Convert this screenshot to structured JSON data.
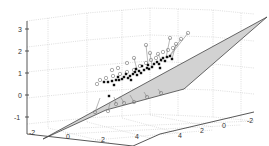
{
  "chart_data": {
    "type": "scatter",
    "subtype": "3d-scatter-with-regression-plane",
    "title": "",
    "xlabel": "",
    "ylabel": "",
    "zlabel": "",
    "x_ticks": [
      "-2",
      "0",
      "2",
      "4"
    ],
    "y_ticks": [
      "4",
      "2",
      "0",
      "-2"
    ],
    "z_ticks": [
      "3",
      "2",
      "1",
      "0",
      "-1"
    ],
    "xlim": [
      -2,
      5
    ],
    "ylim": [
      -2,
      5
    ],
    "zlim": [
      -1.2,
      3.2
    ],
    "grid": true,
    "legend": null,
    "plane_color": "#d2d2d2",
    "plane_edge_color": "#444444",
    "plane_vertices_px": [
      [
        43,
        139
      ],
      [
        267,
        17
      ],
      [
        184,
        89
      ],
      [
        106,
        110
      ]
    ],
    "filled_points_px": [
      [
        104,
        82
      ],
      [
        108,
        82
      ],
      [
        112,
        81
      ],
      [
        116,
        80
      ],
      [
        119,
        80
      ],
      [
        122,
        79
      ],
      [
        118,
        77
      ],
      [
        124,
        77
      ],
      [
        128,
        78
      ],
      [
        130,
        76
      ],
      [
        126,
        74
      ],
      [
        133,
        74
      ],
      [
        137,
        75
      ],
      [
        135,
        72
      ],
      [
        139,
        71
      ],
      [
        141,
        73
      ],
      [
        144,
        70
      ],
      [
        147,
        68
      ],
      [
        149,
        69
      ],
      [
        152,
        67
      ],
      [
        148,
        65
      ],
      [
        154,
        64
      ],
      [
        157,
        62
      ],
      [
        159,
        64
      ],
      [
        161,
        60
      ],
      [
        163,
        58
      ],
      [
        165,
        61
      ],
      [
        167,
        57
      ],
      [
        160,
        68
      ],
      [
        142,
        66
      ],
      [
        136,
        69
      ],
      [
        131,
        80
      ],
      [
        114,
        85
      ],
      [
        109,
        96
      ],
      [
        170,
        56
      ],
      [
        172,
        59
      ]
    ],
    "open_points_px": [
      [
        100,
        80
      ],
      [
        106,
        78
      ],
      [
        113,
        76
      ],
      [
        120,
        74
      ],
      [
        127,
        72
      ],
      [
        134,
        70
      ],
      [
        140,
        66
      ],
      [
        146,
        63
      ],
      [
        151,
        60
      ],
      [
        156,
        58
      ],
      [
        158,
        54
      ],
      [
        163,
        52
      ],
      [
        168,
        50
      ],
      [
        173,
        48
      ],
      [
        176,
        44
      ],
      [
        181,
        39
      ],
      [
        188,
        33
      ],
      [
        170,
        38
      ],
      [
        150,
        53
      ],
      [
        146,
        45
      ],
      [
        97,
        84
      ],
      [
        95,
        112
      ],
      [
        108,
        111
      ],
      [
        116,
        104
      ],
      [
        124,
        103
      ],
      [
        134,
        102
      ],
      [
        147,
        97
      ],
      [
        161,
        93
      ],
      [
        134,
        58
      ],
      [
        127,
        63
      ],
      [
        118,
        68
      ],
      [
        112,
        70
      ]
    ],
    "stems_px": [
      [
        [
          176,
          44
        ],
        [
          172,
          59
        ]
      ],
      [
        [
          181,
          39
        ],
        [
          168,
          58
        ]
      ],
      [
        [
          188,
          33
        ],
        [
          170,
          56
        ]
      ],
      [
        [
          158,
          54
        ],
        [
          162,
          62
        ]
      ],
      [
        [
          146,
          45
        ],
        [
          148,
          64
        ]
      ],
      [
        [
          170,
          38
        ],
        [
          166,
          58
        ]
      ],
      [
        [
          150,
          53
        ],
        [
          152,
          66
        ]
      ],
      [
        [
          95,
          112
        ],
        [
          100,
          98
        ]
      ],
      [
        [
          108,
          111
        ],
        [
          110,
          103
        ]
      ],
      [
        [
          116,
          104
        ],
        [
          114,
          97
        ]
      ],
      [
        [
          124,
          103
        ],
        [
          120,
          96
        ]
      ],
      [
        [
          134,
          102
        ],
        [
          130,
          95
        ]
      ],
      [
        [
          147,
          97
        ],
        [
          144,
          92
        ]
      ],
      [
        [
          161,
          93
        ],
        [
          158,
          89
        ]
      ],
      [
        [
          134,
          58
        ],
        [
          137,
          70
        ]
      ]
    ]
  }
}
